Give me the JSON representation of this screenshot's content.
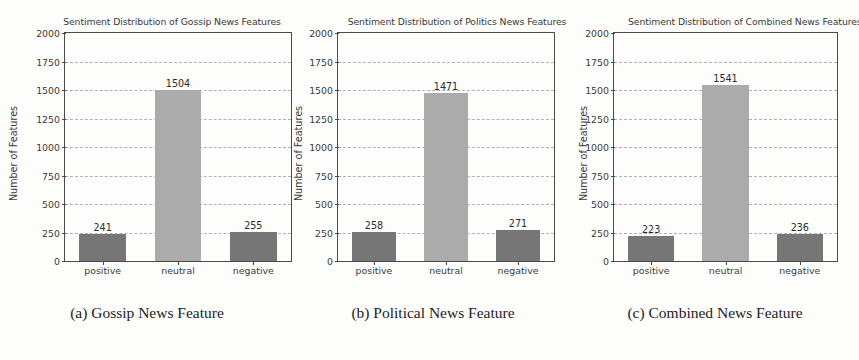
{
  "figure": {
    "background_color": "#fdfdfb",
    "panels": [
      {
        "caption": "(a) Gossip News Feature",
        "chart_data": {
          "type": "bar",
          "title": "Sentiment Distribution of Gossip News Features",
          "xlabel": "",
          "ylabel": "Number of Features",
          "categories": [
            "positive",
            "neutral",
            "negative"
          ],
          "values": [
            241,
            1504,
            255
          ],
          "bar_colors": [
            "#767676",
            "#ababab",
            "#767676"
          ],
          "ylim": [
            0,
            2000
          ],
          "yticks": [
            0,
            250,
            500,
            750,
            1000,
            1250,
            1500,
            1750,
            2000
          ],
          "ytick_labels": [
            "0",
            "250",
            "500",
            "750",
            "1000",
            "1250",
            "1500",
            "1750",
            "2000"
          ],
          "grid": true,
          "grid_axis": "y",
          "grid_style": "dashed",
          "grid_color": "#9aa7b4",
          "legend": false,
          "data_labels": [
            "241",
            "1504",
            "255"
          ]
        }
      },
      {
        "caption": "(b) Political News Feature",
        "chart_data": {
          "type": "bar",
          "title": "Sentiment Distribution of Politics News Features",
          "xlabel": "",
          "ylabel": "Number of Features",
          "categories": [
            "positive",
            "neutral",
            "negative"
          ],
          "values": [
            258,
            1471,
            271
          ],
          "bar_colors": [
            "#767676",
            "#ababab",
            "#767676"
          ],
          "ylim": [
            0,
            2000
          ],
          "yticks": [
            0,
            250,
            500,
            750,
            1000,
            1250,
            1500,
            1750,
            2000
          ],
          "ytick_labels": [
            "0",
            "250",
            "500",
            "750",
            "1000",
            "1250",
            "1500",
            "1750",
            "2000"
          ],
          "grid": true,
          "grid_axis": "y",
          "grid_style": "dashed",
          "grid_color": "#9aa7b4",
          "legend": false,
          "data_labels": [
            "258",
            "1471",
            "271"
          ]
        }
      },
      {
        "caption": "(c) Combined News Feature",
        "chart_data": {
          "type": "bar",
          "title": "Sentiment Distribution of Combined News Features",
          "xlabel": "",
          "ylabel": "Number of Features",
          "categories": [
            "positive",
            "neutral",
            "negative"
          ],
          "values": [
            223,
            1541,
            236
          ],
          "bar_colors": [
            "#767676",
            "#ababab",
            "#767676"
          ],
          "ylim": [
            0,
            2000
          ],
          "yticks": [
            0,
            250,
            500,
            750,
            1000,
            1250,
            1500,
            1750,
            2000
          ],
          "ytick_labels": [
            "0",
            "250",
            "500",
            "750",
            "1000",
            "1250",
            "1500",
            "1750",
            "2000"
          ],
          "grid": true,
          "grid_axis": "y",
          "grid_style": "dashed",
          "grid_color": "#9aa7b4",
          "legend": false,
          "data_labels": [
            "223",
            "1541",
            "236"
          ]
        }
      }
    ]
  },
  "chart_data": [
    {
      "type": "bar",
      "title": "Sentiment Distribution of Gossip News Features",
      "categories": [
        "positive",
        "neutral",
        "negative"
      ],
      "values": [
        241,
        1504,
        255
      ],
      "xlabel": "",
      "ylabel": "Number of Features",
      "ylim": [
        0,
        2000
      ]
    },
    {
      "type": "bar",
      "title": "Sentiment Distribution of Politics News Features",
      "categories": [
        "positive",
        "neutral",
        "negative"
      ],
      "values": [
        258,
        1471,
        271
      ],
      "xlabel": "",
      "ylabel": "Number of Features",
      "ylim": [
        0,
        2000
      ]
    },
    {
      "type": "bar",
      "title": "Sentiment Distribution of Combined News Features",
      "categories": [
        "positive",
        "neutral",
        "negative"
      ],
      "values": [
        223,
        1541,
        236
      ],
      "xlabel": "",
      "ylabel": "Number of Features",
      "ylim": [
        0,
        2000
      ]
    }
  ]
}
